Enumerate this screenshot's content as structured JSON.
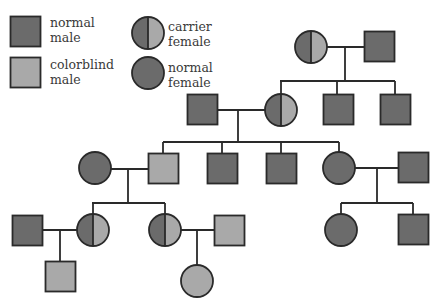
{
  "colors": {
    "background": "#ffffff",
    "affected_dark": "#6b6b6b",
    "colorblind_light": "#a9a9a9",
    "stroke": "#2a2a2a",
    "text": "#3a3a3a"
  },
  "legend": [
    {
      "symbol": "square",
      "fill": "dark",
      "line1": "normal",
      "line2": "male",
      "x": 10,
      "y": 16,
      "label_x": 50,
      "label_y": 15
    },
    {
      "symbol": "square",
      "fill": "light",
      "line1": "colorblind",
      "line2": "male",
      "x": 10,
      "y": 57,
      "label_x": 50,
      "label_y": 57
    },
    {
      "symbol": "circle",
      "fill": "carrier",
      "line1": "carrier",
      "line2": "female",
      "cx": 148,
      "cy": 33,
      "label_x": 168,
      "label_y": 22
    },
    {
      "symbol": "circle",
      "fill": "dark",
      "line1": "normal",
      "line2": "female",
      "cx": 148,
      "cy": 73,
      "label_x": 168,
      "label_y": 62
    }
  ],
  "pedigree": {
    "individuals": [
      {
        "id": "I-1",
        "generation": 1,
        "sex": "female",
        "status": "carrier female",
        "cx": 311,
        "cy": 47
      },
      {
        "id": "I-2",
        "generation": 1,
        "sex": "male",
        "status": "normal male",
        "x": 364,
        "y": 31
      },
      {
        "id": "II-1",
        "generation": 2,
        "sex": "male",
        "status": "normal male",
        "x": 187,
        "y": 94
      },
      {
        "id": "II-2",
        "generation": 2,
        "sex": "female",
        "status": "carrier female",
        "cx": 281,
        "cy": 110
      },
      {
        "id": "II-3",
        "generation": 2,
        "sex": "male",
        "status": "normal male",
        "x": 323,
        "y": 94
      },
      {
        "id": "II-4",
        "generation": 2,
        "sex": "male",
        "status": "normal male",
        "x": 380,
        "y": 94
      },
      {
        "id": "III-1",
        "generation": 3,
        "sex": "female",
        "status": "normal female",
        "cx": 95,
        "cy": 168
      },
      {
        "id": "III-2",
        "generation": 3,
        "sex": "male",
        "status": "colorblind male",
        "x": 148,
        "y": 153
      },
      {
        "id": "III-3",
        "generation": 3,
        "sex": "male",
        "status": "normal male",
        "x": 207,
        "y": 153
      },
      {
        "id": "III-4",
        "generation": 3,
        "sex": "male",
        "status": "normal male",
        "x": 266,
        "y": 153
      },
      {
        "id": "III-5",
        "generation": 3,
        "sex": "female",
        "status": "normal female",
        "cx": 339,
        "cy": 168
      },
      {
        "id": "III-6",
        "generation": 3,
        "sex": "male",
        "status": "normal male",
        "x": 398,
        "y": 152
      },
      {
        "id": "IV-1",
        "generation": 4,
        "sex": "male",
        "status": "normal male",
        "x": 12,
        "y": 215
      },
      {
        "id": "IV-2",
        "generation": 4,
        "sex": "female",
        "status": "carrier female",
        "cx": 93,
        "cy": 230
      },
      {
        "id": "IV-3",
        "generation": 4,
        "sex": "female",
        "status": "carrier female",
        "cx": 165,
        "cy": 230
      },
      {
        "id": "IV-4",
        "generation": 4,
        "sex": "male",
        "status": "colorblind male",
        "x": 214,
        "y": 215
      },
      {
        "id": "IV-5",
        "generation": 4,
        "sex": "female",
        "status": "normal female",
        "cx": 341,
        "cy": 230
      },
      {
        "id": "IV-6",
        "generation": 4,
        "sex": "male",
        "status": "normal male",
        "x": 398,
        "y": 214
      },
      {
        "id": "V-1",
        "generation": 5,
        "sex": "male",
        "status": "colorblind male",
        "x": 45,
        "y": 261
      },
      {
        "id": "V-2",
        "generation": 5,
        "sex": "female",
        "status": "colorblind female",
        "cx": 197,
        "cy": 281
      }
    ],
    "lines": [
      [
        327,
        47,
        364,
        47
      ],
      [
        345,
        47,
        345,
        81
      ],
      [
        280,
        81,
        395,
        81
      ],
      [
        281,
        81,
        281,
        94
      ],
      [
        337,
        81,
        337,
        94
      ],
      [
        395,
        81,
        395,
        94
      ],
      [
        218,
        110,
        265,
        110
      ],
      [
        238,
        110,
        238,
        142
      ],
      [
        163,
        142,
        339,
        142
      ],
      [
        163,
        142,
        163,
        153
      ],
      [
        222,
        142,
        222,
        153
      ],
      [
        281,
        142,
        281,
        153
      ],
      [
        339,
        142,
        339,
        152
      ],
      [
        111,
        169,
        148,
        169
      ],
      [
        128,
        169,
        128,
        203
      ],
      [
        92,
        203,
        165,
        203
      ],
      [
        93,
        203,
        93,
        214
      ],
      [
        165,
        203,
        165,
        214
      ],
      [
        355,
        168,
        398,
        168
      ],
      [
        377,
        168,
        377,
        203
      ],
      [
        341,
        203,
        413,
        203
      ],
      [
        341,
        203,
        341,
        214
      ],
      [
        413,
        203,
        413,
        214
      ],
      [
        42,
        230,
        77,
        230
      ],
      [
        60,
        230,
        60,
        261
      ],
      [
        181,
        230,
        214,
        230
      ],
      [
        197,
        230,
        197,
        265
      ]
    ],
    "square_size": 30,
    "circle_radius": 16
  }
}
